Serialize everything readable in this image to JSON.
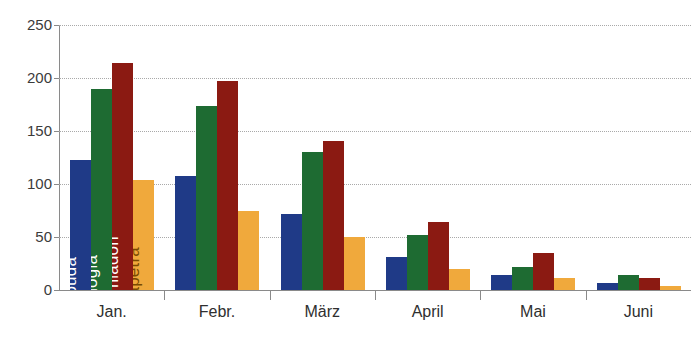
{
  "chart_data": {
    "type": "bar",
    "title": "",
    "xlabel": "",
    "ylabel": "",
    "categories": [
      "Jan.",
      "Febr.",
      "März",
      "April",
      "Mai",
      "Juni"
    ],
    "ylim": [
      0,
      250
    ],
    "yticks": [
      0,
      50,
      100,
      150,
      200,
      250
    ],
    "grid": true,
    "legend_position": "in-bars-january",
    "series": [
      {
        "name": "Soúda",
        "color": "#1F3A87",
        "label_color": "#ffffff",
        "values": [
          123,
          190,
          214,
          31,
          14,
          7
        ]
      },
      {
        "name": "Anógia",
        "color": "#1E6B32",
        "label_color": "#ffffff",
        "values": [
          190,
          174,
          130,
          52,
          22,
          14
        ]
      },
      {
        "name": "Tzermiádon",
        "color": "#8B1A12",
        "label_color": "#ffffff",
        "values": [
          214,
          197,
          141,
          64,
          35,
          11
        ]
      },
      {
        "name": "Ierápetra",
        "color": "#F0A93C",
        "label_color": "#7a4a00",
        "values": [
          104,
          75,
          50,
          20,
          11,
          4
        ]
      }
    ],
    "series_values_by_category": {
      "Jan.": [
        123,
        190,
        214,
        104
      ],
      "Febr.": [
        108,
        174,
        197,
        75
      ],
      "März": [
        72,
        130,
        141,
        50
      ],
      "April": [
        31,
        52,
        64,
        20
      ],
      "Mai": [
        14,
        22,
        35,
        11
      ],
      "Juni": [
        7,
        14,
        11,
        4
      ]
    }
  },
  "axis": {
    "y_tick_labels": [
      "250",
      "200",
      "150",
      "100",
      "50",
      "0"
    ]
  },
  "title_fragment": ""
}
